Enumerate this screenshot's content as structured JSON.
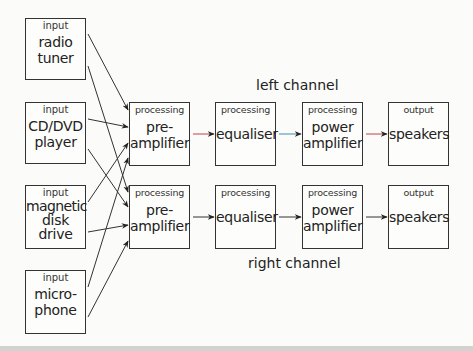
{
  "inputs": [
    {
      "category": "input",
      "label_line1": "radio",
      "label_line2": "tuner",
      "label_line3": ""
    },
    {
      "category": "input",
      "label_line1": "CD/DVD",
      "label_line2": "player",
      "label_line3": ""
    },
    {
      "category": "input",
      "label_line1": "magnetic",
      "label_line2": "disk",
      "label_line3": "drive"
    },
    {
      "category": "input",
      "label_line1": "micro-",
      "label_line2": "phone",
      "label_line3": ""
    }
  ],
  "channels": {
    "left": {
      "label": "left channel",
      "stages": [
        {
          "category": "processing",
          "label_line1": "pre-",
          "label_line2": "amplifier"
        },
        {
          "category": "processing",
          "label_line1": "equaliser",
          "label_line2": ""
        },
        {
          "category": "processing",
          "label_line1": "power",
          "label_line2": "amplifier"
        },
        {
          "category": "output",
          "label_line1": "speakers",
          "label_line2": ""
        }
      ],
      "connector_colors": [
        "#c0404a",
        "#3f8fa8",
        "#c0404a"
      ]
    },
    "right": {
      "label": "right channel",
      "stages": [
        {
          "category": "processing",
          "label_line1": "pre-",
          "label_line2": "amplifier"
        },
        {
          "category": "processing",
          "label_line1": "equaliser",
          "label_line2": ""
        },
        {
          "category": "processing",
          "label_line1": "power",
          "label_line2": "amplifier"
        },
        {
          "category": "output",
          "label_line1": "speakers",
          "label_line2": ""
        }
      ],
      "connector_colors": [
        "#222222",
        "#222222",
        "#222222"
      ]
    }
  }
}
